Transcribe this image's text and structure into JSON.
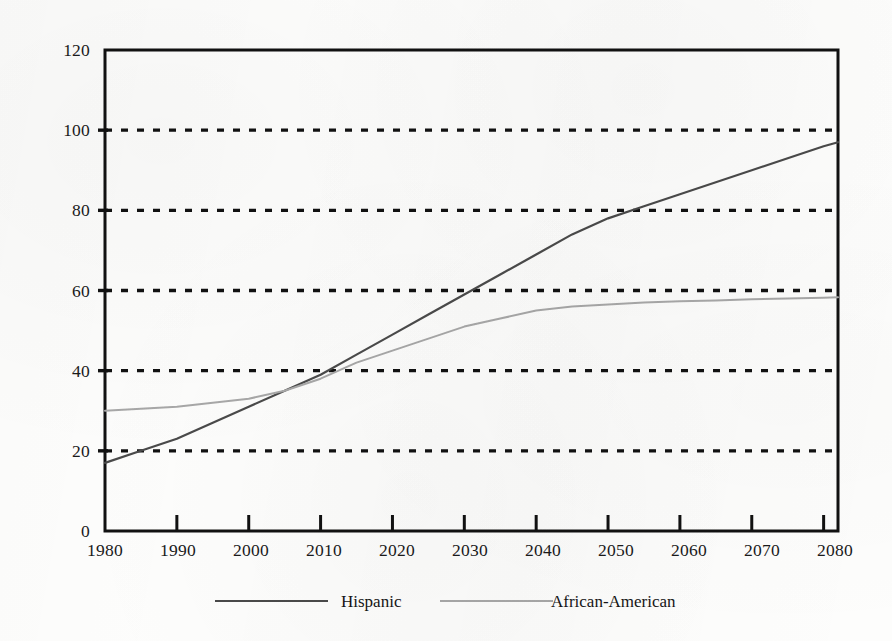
{
  "chart_data": {
    "type": "line",
    "title": "",
    "subtitle": "",
    "xlabel": "",
    "ylabel": "",
    "xlim": [
      1980,
      2082
    ],
    "ylim": [
      0,
      120
    ],
    "grid": "horizontal-dashed",
    "legend_position": "bottom",
    "x_ticks": [
      "1980",
      "1990",
      "2000",
      "2010",
      "2020",
      "2030",
      "2040",
      "2050",
      "2060",
      "2070",
      "2080"
    ],
    "y_ticks": [
      "0",
      "20",
      "40",
      "60",
      "80",
      "100",
      "120"
    ],
    "x": [
      1980,
      1985,
      1990,
      1995,
      2000,
      2005,
      2010,
      2015,
      2020,
      2025,
      2030,
      2035,
      2040,
      2045,
      2050,
      2055,
      2060,
      2065,
      2070,
      2075,
      2080,
      2082
    ],
    "series": [
      {
        "name": "Hispanic",
        "color": "#4a4a4a",
        "values": [
          17,
          20,
          23,
          27,
          31,
          35,
          39,
          44,
          49,
          54,
          59,
          64,
          69,
          74,
          78,
          81,
          84,
          87,
          90,
          93,
          96,
          97
        ]
      },
      {
        "name": "African-American",
        "color": "#a8a8a8",
        "values": [
          30,
          30.5,
          31,
          32,
          33,
          35,
          38,
          42,
          45,
          48,
          51,
          53,
          55,
          56,
          56.5,
          57,
          57.3,
          57.5,
          57.8,
          58,
          58.2,
          58.3
        ]
      }
    ],
    "annotations": []
  },
  "legend": {
    "items": [
      {
        "label": "Hispanic",
        "color": "#4a4a4a"
      },
      {
        "label": "African-American",
        "color": "#a8a8a8"
      }
    ]
  },
  "axes": {
    "y_tick_values": [
      "120",
      "100",
      "80",
      "60",
      "40",
      "20",
      "0"
    ],
    "x_tick_values": [
      "1980",
      "1990",
      "2000",
      "2010",
      "2020",
      "2030",
      "2040",
      "2050",
      "2060",
      "2070",
      "2080"
    ]
  },
  "colors": {
    "hispanic_line": "#4a4a4a",
    "african_american_line": "#a8a8a8",
    "axis": "#111111",
    "gridline": "#111111",
    "background": "#fdfdfc"
  }
}
